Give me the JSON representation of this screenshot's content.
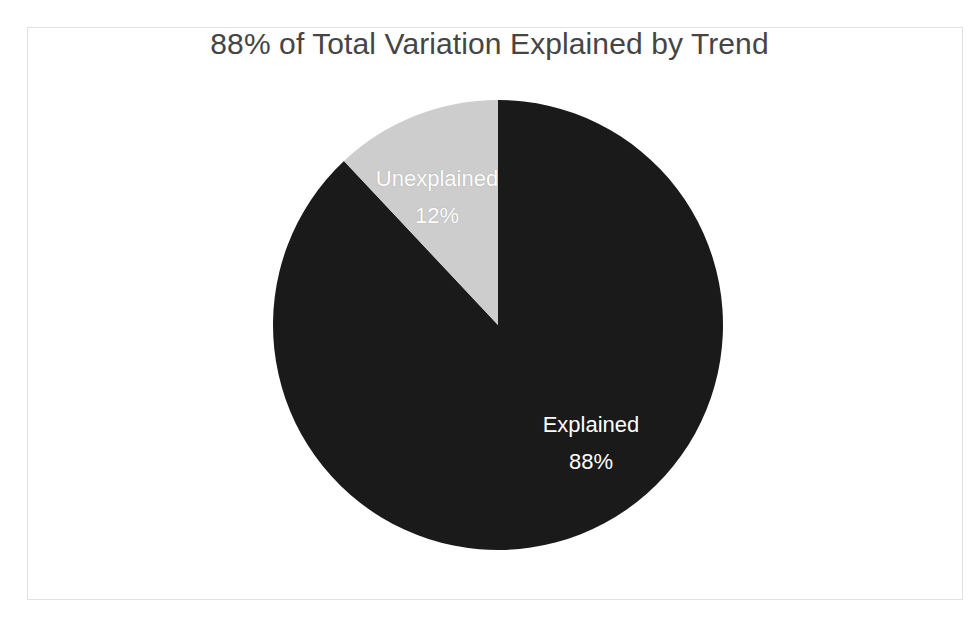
{
  "chart_data": {
    "type": "pie",
    "title": "88% of Total Variation Explained by Trend",
    "xlabel": "",
    "ylabel": "",
    "legend": "none",
    "grid": false,
    "start_angle_deg": 0,
    "direction": "clockwise",
    "categories": [
      "Explained",
      "Unexplained"
    ],
    "values": [
      88,
      12
    ],
    "value_unit": "%",
    "slices": [
      {
        "label": "Explained",
        "value": 88,
        "value_label": "88%",
        "color": "#1a1a1a",
        "label_color": "#ffffff",
        "start_deg": 0,
        "end_deg": 316.8
      },
      {
        "label": "Unexplained",
        "value": 12,
        "value_label": "12%",
        "color": "#cdcdcd",
        "label_color": "#ffffff",
        "start_deg": 316.8,
        "end_deg": 360
      }
    ]
  },
  "chart": {
    "title": "88% of Total Variation Explained by Trend",
    "title_color": "#454545",
    "background": "#ffffff",
    "frame_color": "#e2e2e2",
    "center_x": 498,
    "center_y": 325,
    "radius": 225
  },
  "labels": {
    "unexplained_name": "Unexplained",
    "unexplained_value": "12%",
    "explained_name": "Explained",
    "explained_value": "88%"
  }
}
